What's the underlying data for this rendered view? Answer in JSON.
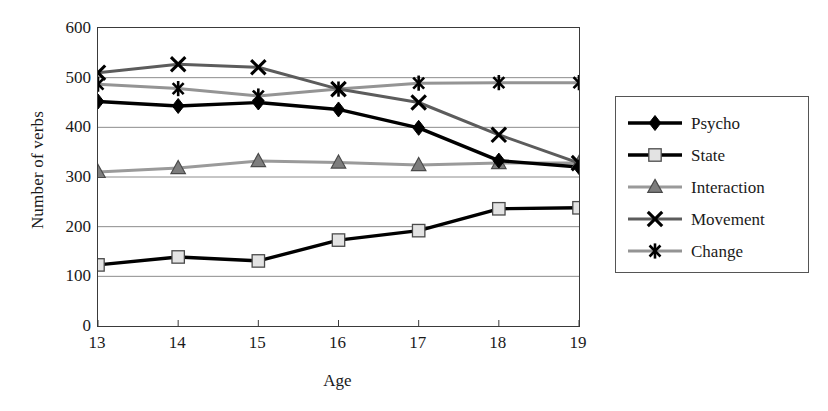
{
  "chart_data": {
    "type": "line",
    "title": "",
    "xlabel": "Age",
    "ylabel": "Number of verbs",
    "categories": [
      "13",
      "14",
      "15",
      "16",
      "17",
      "18",
      "19"
    ],
    "x": [
      13,
      14,
      15,
      16,
      17,
      18,
      19
    ],
    "xlim": [
      13,
      19
    ],
    "ylim": [
      0,
      600
    ],
    "y_ticks": [
      "0",
      "100",
      "200",
      "300",
      "400",
      "500",
      "600"
    ],
    "y_tick_values": [
      0,
      100,
      200,
      300,
      400,
      500,
      600
    ],
    "grid": "horizontal",
    "legend_position": "right",
    "series": [
      {
        "name": "Psycho",
        "marker": "diamond",
        "line_color": "#000000",
        "marker_fill": "#000000",
        "marker_edge": "#000000",
        "values": [
          452,
          443,
          450,
          436,
          399,
          333,
          320
        ]
      },
      {
        "name": "State",
        "marker": "square",
        "line_color": "#000000",
        "marker_fill": "#e3e3e3",
        "marker_edge": "#4a4a4a",
        "values": [
          123,
          139,
          131,
          173,
          192,
          236,
          238
        ]
      },
      {
        "name": "Interaction",
        "marker": "triangle",
        "line_color": "#9a9a9a",
        "marker_fill": "#7d7d7d",
        "marker_edge": "#4a4a4a",
        "values": [
          310,
          318,
          332,
          329,
          324,
          328,
          328
        ]
      },
      {
        "name": "Movement",
        "marker": "x",
        "line_color": "#5c5c5c",
        "marker_fill": "#000000",
        "marker_edge": "#000000",
        "values": [
          510,
          527,
          521,
          477,
          450,
          385,
          328
        ]
      },
      {
        "name": "Change",
        "marker": "asterisk",
        "line_color": "#949494",
        "marker_fill": "#000000",
        "marker_edge": "#000000",
        "values": [
          487,
          478,
          463,
          477,
          489,
          490,
          490
        ]
      }
    ]
  },
  "axes": {
    "y_title": "Number of verbs",
    "x_title": "Age"
  },
  "legend": {
    "entries": [
      {
        "label": "Psycho"
      },
      {
        "label": "State"
      },
      {
        "label": "Interaction"
      },
      {
        "label": "Movement"
      },
      {
        "label": "Change"
      }
    ]
  },
  "colors": {
    "frame": "#3a3a3a",
    "gridline": "#8c8c8c",
    "text": "#1a1a1a",
    "background": "#ffffff"
  }
}
